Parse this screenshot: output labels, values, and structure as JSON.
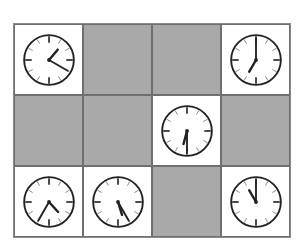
{
  "board": {
    "rows": 3,
    "cols": 4,
    "colors": {
      "empty_cell": "#a9a9a9",
      "clock_cell": "#ffffff",
      "clock_stroke": "#222222"
    },
    "cells": [
      {
        "row": 0,
        "col": 0,
        "type": "clock",
        "time": "1:20",
        "hour": 1,
        "minute": 20
      },
      {
        "row": 0,
        "col": 1,
        "type": "empty"
      },
      {
        "row": 0,
        "col": 2,
        "type": "empty"
      },
      {
        "row": 0,
        "col": 3,
        "type": "clock",
        "time": "7:00",
        "hour": 7,
        "minute": 0
      },
      {
        "row": 1,
        "col": 0,
        "type": "empty"
      },
      {
        "row": 1,
        "col": 1,
        "type": "empty"
      },
      {
        "row": 1,
        "col": 2,
        "type": "clock",
        "time": "6:30",
        "hour": 6,
        "minute": 30
      },
      {
        "row": 1,
        "col": 3,
        "type": "empty"
      },
      {
        "row": 2,
        "col": 0,
        "type": "clock",
        "time": "4:35",
        "hour": 4,
        "minute": 35
      },
      {
        "row": 2,
        "col": 1,
        "type": "clock",
        "time": "5:25",
        "hour": 5,
        "minute": 25
      },
      {
        "row": 2,
        "col": 2,
        "type": "empty"
      },
      {
        "row": 2,
        "col": 3,
        "type": "clock",
        "time": "11:00",
        "hour": 11,
        "minute": 0
      }
    ]
  }
}
